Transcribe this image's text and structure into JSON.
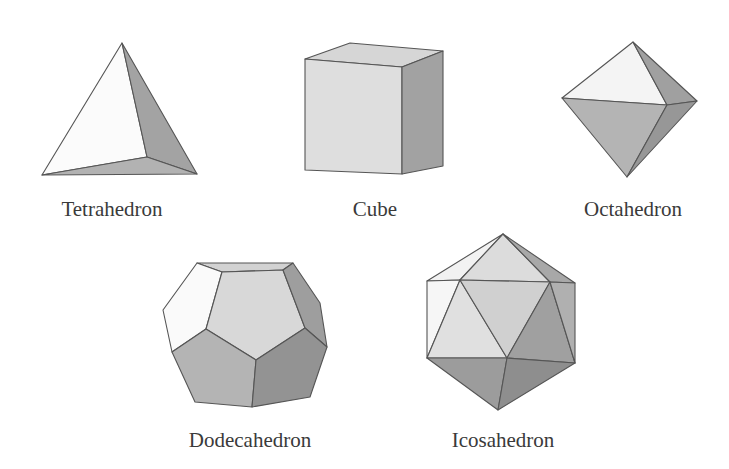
{
  "figure": {
    "solids": [
      {
        "name": "Tetrahedron",
        "faces": 4,
        "label_x": 112,
        "label_y": 199
      },
      {
        "name": "Cube",
        "faces": 6,
        "label_x": 375,
        "label_y": 199
      },
      {
        "name": "Octahedron",
        "faces": 8,
        "label_x": 633,
        "label_y": 199
      },
      {
        "name": "Dodecahedron",
        "faces": 12,
        "label_x": 250,
        "label_y": 430
      },
      {
        "name": "Icosahedron",
        "faces": 20,
        "label_x": 503,
        "label_y": 430
      }
    ]
  },
  "colors": {
    "background": "#ffffff",
    "face_white": "#fbfbfb",
    "face_light": "#dcdcdc",
    "face_mid": "#bdbdbd",
    "face_dark": "#9d9d9d",
    "face_darker": "#8a8a8a",
    "edge": "#555555",
    "label": "#3a3a3a"
  }
}
